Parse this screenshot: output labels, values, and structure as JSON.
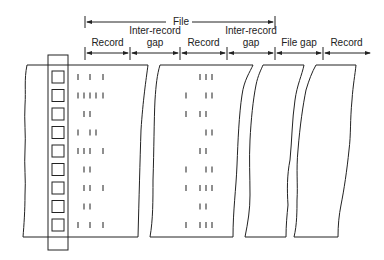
{
  "diagram": {
    "file_label": "File",
    "segments": [
      {
        "label": "Record",
        "x1": 85,
        "x2": 130
      },
      {
        "label": "Inter-record\ngap",
        "line1": "Inter-record",
        "line2": "gap",
        "x1": 130,
        "x2": 180
      },
      {
        "label": "Record",
        "x1": 180,
        "x2": 227
      },
      {
        "label": "Inter-record\ngap",
        "line1": "Inter-record",
        "line2": "gap",
        "x1": 227,
        "x2": 275
      },
      {
        "label": "File gap",
        "x1": 275,
        "x2": 323
      },
      {
        "label": "Record",
        "x1": 323,
        "x2": 370
      }
    ],
    "track_count": 9,
    "record1_marks": [
      [
        0,
        2,
        4
      ],
      [
        0,
        1,
        2,
        3,
        4
      ],
      [
        1,
        2
      ],
      [
        0,
        2,
        3
      ],
      [
        0,
        1,
        2,
        4
      ],
      [
        1,
        2
      ],
      [
        1,
        2,
        4
      ],
      [
        1,
        2
      ],
      [
        0,
        2,
        4
      ]
    ],
    "record2_marks": [
      [
        2,
        3,
        4
      ],
      [
        0,
        3,
        4
      ],
      [
        0,
        2,
        3
      ],
      [
        3,
        4
      ],
      [
        2,
        3
      ],
      [
        0,
        3,
        4
      ],
      [
        0,
        2,
        3,
        4
      ],
      [
        2,
        3
      ],
      [
        0,
        2,
        3,
        4
      ]
    ]
  },
  "labels": {
    "file": "File",
    "seg0": "Record",
    "seg1a": "Inter-record",
    "seg1b": "gap",
    "seg2": "Record",
    "seg3a": "Inter-record",
    "seg3b": "gap",
    "seg4": "File gap",
    "seg5": "Record"
  }
}
